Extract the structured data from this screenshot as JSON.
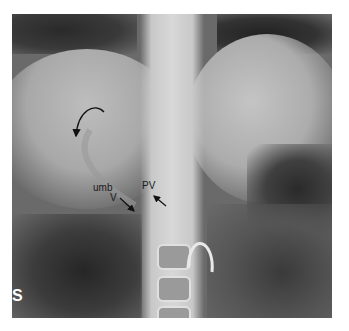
{
  "image": {
    "type": "abdominal radiograph",
    "width": 349,
    "height": 331,
    "film_bounds": {
      "left": 12,
      "top": 14,
      "right": 332,
      "bottom": 318
    }
  },
  "annotations": {
    "umbilical_vein_label_line1": "umb",
    "umbilical_vein_label_line2": "V",
    "portal_vein_label": "PV",
    "side_marker": "S"
  },
  "arrows": [
    {
      "name": "curved-arrow",
      "from": [
        104,
        112
      ],
      "to": [
        76,
        138
      ]
    },
    {
      "name": "umb-v-arrow",
      "from": [
        120,
        198
      ],
      "to": [
        134,
        211
      ]
    },
    {
      "name": "pv-arrow",
      "from": [
        166,
        206
      ],
      "to": [
        153,
        195
      ]
    }
  ],
  "colors": {
    "background": "#ffffff",
    "film_base": "#6a6a6a",
    "label_text": "#1a1a1a",
    "catheter": "#e8e8e8"
  }
}
